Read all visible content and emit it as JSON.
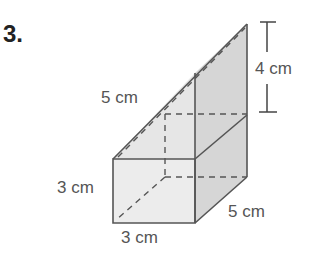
{
  "problem": {
    "number": "3.",
    "labels": {
      "slant": "5 cm",
      "height_top": "4 cm",
      "height_front": "3 cm",
      "width_front": "3 cm",
      "depth": "5 cm"
    }
  },
  "colors": {
    "edge": "#555555",
    "front_face": "#ebebeb",
    "side_face": "#d4d4d4",
    "top_face": "#e4e4e4"
  }
}
